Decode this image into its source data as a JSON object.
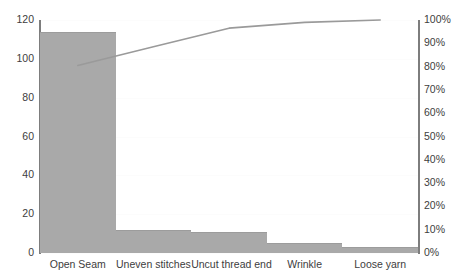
{
  "chart_data": {
    "type": "bar",
    "title": "",
    "subtitle": "",
    "xlabel": "",
    "ylabel": "",
    "y2label": "",
    "categories": [
      "Open Seam",
      "Uneven stitches",
      "Uncut thread end",
      "Wrinkle",
      "Loose yarn"
    ],
    "series": [
      {
        "name": "Defect count",
        "type": "bar",
        "axis": "left",
        "values": [
          114,
          12,
          11,
          5,
          3
        ],
        "color": "#a9a9a9"
      },
      {
        "name": "Cumulative percentage",
        "type": "line",
        "axis": "right",
        "values": [
          80.5,
          88.5,
          96.5,
          99.0,
          100.0
        ],
        "color": "#9a9a9a"
      }
    ],
    "ylim": [
      0,
      120
    ],
    "yticks": [
      "0",
      "20",
      "40",
      "60",
      "80",
      "100",
      "120"
    ],
    "y2lim": [
      0,
      100
    ],
    "y2ticks": [
      "0%",
      "10%",
      "20%",
      "30%",
      "40%",
      "50%",
      "60%",
      "70%",
      "80%",
      "90%",
      "100%"
    ],
    "grid": true,
    "legend": false,
    "legend_position": "none",
    "annotations": []
  },
  "colors": {
    "bar_fill": "#a9a9a9",
    "line": "#9a9a9a",
    "axis": "#7d7d7d",
    "text": "#3d3d3d",
    "gridline": "#fcfcfc",
    "background": "#ffffff"
  }
}
